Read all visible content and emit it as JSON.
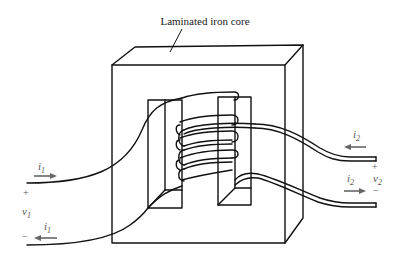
{
  "labels": {
    "core": "Laminated iron core"
  },
  "primary": {
    "current_top": {
      "symbol": "i",
      "subscript": "1"
    },
    "current_bottom": {
      "symbol": "i",
      "subscript": "1"
    },
    "voltage": {
      "symbol": "v",
      "subscript": "1"
    },
    "plus": "+",
    "minus": "−"
  },
  "secondary": {
    "current_top": {
      "symbol": "i",
      "subscript": "2"
    },
    "current_bottom": {
      "symbol": "i",
      "subscript": "2"
    },
    "voltage": {
      "symbol": "v",
      "subscript": "2"
    },
    "plus": "+",
    "minus": "−"
  },
  "colors": {
    "line": "#111111",
    "arrow": "#666666",
    "background": "#ffffff"
  }
}
